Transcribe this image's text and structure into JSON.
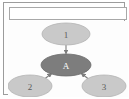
{
  "panel": {
    "header_text": ""
  },
  "graph": {
    "type": "directed-graph",
    "nodes": [
      {
        "id": "n1",
        "label": "1",
        "shape": "ellipse",
        "fill": "#c9c9c9",
        "stroke": "#b0b0b0",
        "text_color": "#5a5a5a",
        "cx": 58,
        "cy": 13,
        "rx": 24,
        "ry": 11
      },
      {
        "id": "nA",
        "label": "A",
        "shape": "ellipse",
        "fill": "#7d7d7d",
        "stroke": "#6d6d6d",
        "text_color": "#ffffff",
        "cx": 58,
        "cy": 44,
        "rx": 25,
        "ry": 11
      },
      {
        "id": "n2",
        "label": "2",
        "shape": "ellipse",
        "fill": "#c9c9c9",
        "stroke": "#b0b0b0",
        "text_color": "#5a5a5a",
        "cx": 22,
        "cy": 65,
        "rx": 22,
        "ry": 11
      },
      {
        "id": "n3",
        "label": "3",
        "shape": "ellipse",
        "fill": "#c9c9c9",
        "stroke": "#b0b0b0",
        "text_color": "#5a5a5a",
        "cx": 96,
        "cy": 65,
        "rx": 22,
        "ry": 11
      }
    ],
    "edges": [
      {
        "id": "e1",
        "from": "n1",
        "to": "nA",
        "arrow": true,
        "x1": 58,
        "y1": 24,
        "x2": 58,
        "y2": 33
      },
      {
        "id": "e2",
        "from": "n2",
        "to": "nA",
        "arrow": true,
        "x1": 34,
        "y1": 60,
        "x2": 44,
        "y2": 52
      },
      {
        "id": "e3",
        "from": "n3",
        "to": "nA",
        "arrow": true,
        "x1": 83,
        "y1": 60,
        "x2": 73,
        "y2": 52
      }
    ],
    "edge_color": "#7d7d7d"
  }
}
